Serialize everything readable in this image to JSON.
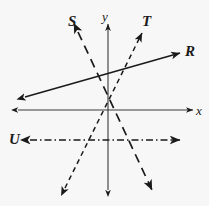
{
  "figure": {
    "background_color": "#f7f7f7",
    "stroke_color": "#1a1a1a",
    "width": 209,
    "height": 206
  },
  "axes": {
    "origin": {
      "x": 107,
      "y": 110
    },
    "x_axis": {
      "label": "x",
      "style": "solid",
      "start": {
        "x": 18,
        "y": 110
      },
      "end": {
        "x": 193,
        "y": 110
      },
      "arrows": "both"
    },
    "y_axis": {
      "label": "y",
      "style": "solid",
      "start": {
        "x": 108,
        "y": 190
      },
      "end": {
        "x": 108,
        "y": 24
      },
      "arrows": "both"
    }
  },
  "lines": [
    {
      "label": "S",
      "style": "long-dash",
      "slope_sign": "negative",
      "from": {
        "x": 78,
        "y": 32
      },
      "to": {
        "x": 152,
        "y": 190
      },
      "arrows": "both"
    },
    {
      "label": "T",
      "style": "short-dash",
      "slope_sign": "positive",
      "from": {
        "x": 65,
        "y": 188
      },
      "to": {
        "x": 142,
        "y": 33
      },
      "arrows": "both"
    },
    {
      "label": "R",
      "style": "solid",
      "slope_sign": "positive",
      "from": {
        "x": 25,
        "y": 97
      },
      "to": {
        "x": 180,
        "y": 53
      },
      "arrows": "both"
    },
    {
      "label": "U",
      "style": "dash-dot",
      "slope_sign": "zero",
      "from": {
        "x": 30,
        "y": 140
      },
      "to": {
        "x": 180,
        "y": 140
      },
      "arrows": "both"
    }
  ],
  "labels": {
    "S": "S",
    "T": "T",
    "R": "R",
    "U": "U",
    "x": "x",
    "y": "y"
  }
}
